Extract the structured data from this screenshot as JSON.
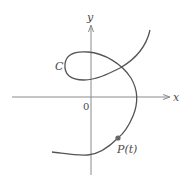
{
  "diagram": {
    "axes": {
      "x_label": "x",
      "y_label": "y",
      "origin_label": "0"
    },
    "curve": {
      "label": "C",
      "color": "#555555"
    },
    "point": {
      "label": "P(t)",
      "color": "#666666"
    },
    "axis_color": "#8a8a8a"
  }
}
